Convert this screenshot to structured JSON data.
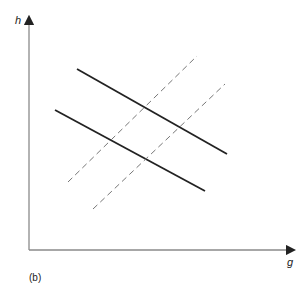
{
  "axes": {
    "y_label": "h",
    "x_label": "g"
  },
  "panel_label": "(b)",
  "lines": {
    "solid": [
      {
        "name": "upper-solid",
        "x1": 77,
        "y1": 69,
        "x2": 227,
        "y2": 154
      },
      {
        "name": "lower-solid",
        "x1": 55,
        "y1": 110,
        "x2": 205,
        "y2": 191
      }
    ],
    "dashed": [
      {
        "name": "upper-dashed",
        "x1": 68,
        "y1": 182,
        "x2": 197,
        "y2": 56
      },
      {
        "name": "lower-dashed",
        "x1": 93,
        "y1": 209,
        "x2": 225,
        "y2": 84
      }
    ]
  },
  "colors": {
    "axis": "#8a8a8a",
    "solid": "#222222",
    "dashed": "#777777"
  }
}
